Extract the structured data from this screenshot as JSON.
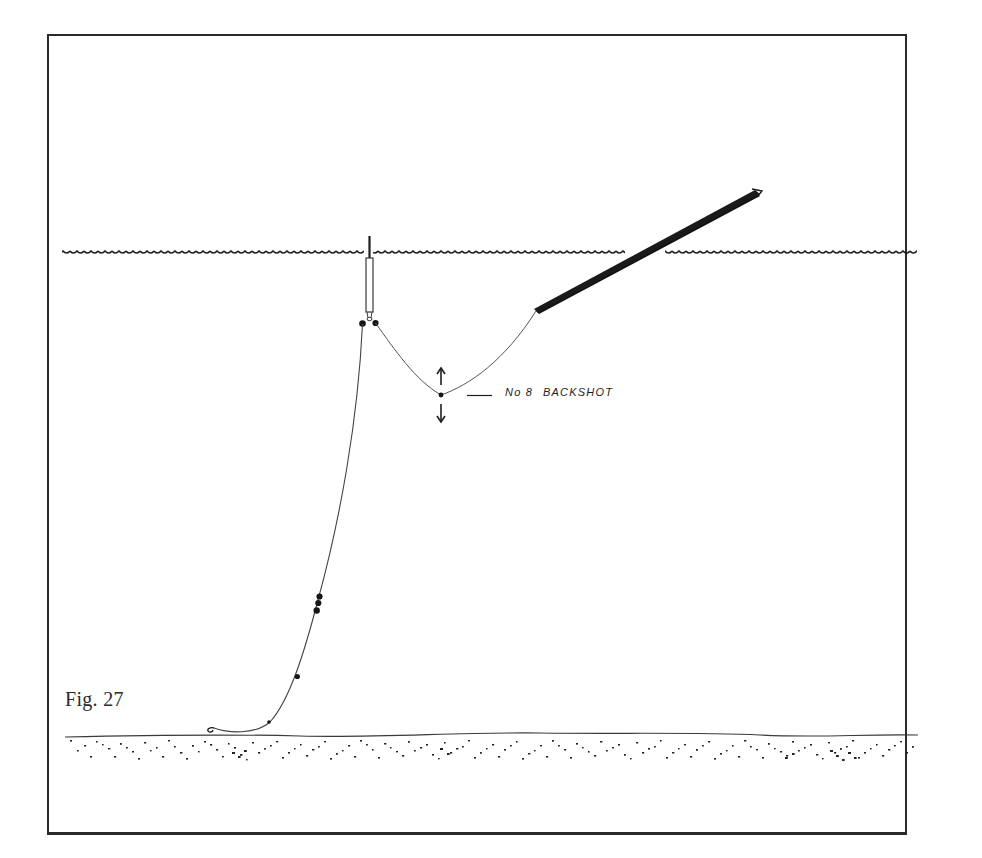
{
  "figure": {
    "label": "Fig. 27",
    "annotation": {
      "prefix": "No 8",
      "text": "BACKSHOT"
    },
    "elements": {
      "water_surface": "wavy line",
      "float": "antenna float with locking shots",
      "rod": "rod tip entering water",
      "backshot": "No 8 shot on line between float and rod",
      "main_line_shots": "bulk shot cluster plus two droppers",
      "hook": "hook resting on bottom",
      "bottom": "stippled lake bed"
    },
    "colors": {
      "ink": "#1e1e1e",
      "frame": "#2a2a2a",
      "paper": "#ffffff"
    }
  }
}
